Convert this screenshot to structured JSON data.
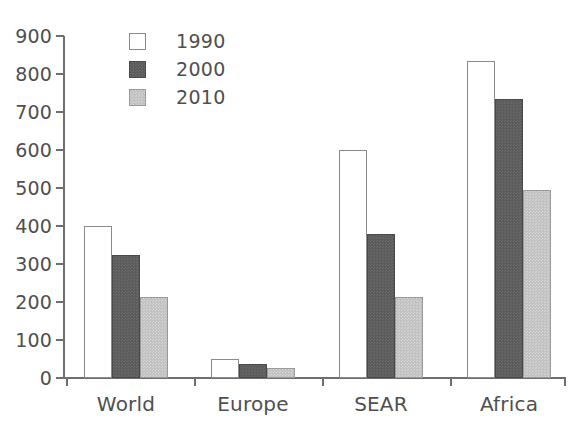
{
  "chart_data": {
    "type": "bar",
    "title": "",
    "xlabel": "",
    "ylabel": "",
    "categories": [
      "World",
      "Europe",
      "SEAR",
      "Africa"
    ],
    "series": [
      {
        "name": "1990",
        "color": "#ffffff",
        "values": [
          400,
          50,
          600,
          833
        ]
      },
      {
        "name": "2000",
        "color": "#5c5c5c",
        "values": [
          324,
          37,
          380,
          733
        ]
      },
      {
        "name": "2010",
        "color": "#c2c2c2",
        "values": [
          213,
          27,
          212,
          495
        ]
      }
    ],
    "ylim": [
      0,
      900
    ],
    "ytick_step": 100,
    "yticks": [
      0,
      100,
      200,
      300,
      400,
      500,
      600,
      700,
      800,
      900
    ],
    "ytick_labels": [
      "0",
      "100",
      "200",
      "300",
      "400",
      "500",
      "600",
      "700",
      "800",
      "900"
    ],
    "grid": false,
    "legend_position": "top-left",
    "axis_color": "#6e6e6e",
    "text_color": "#4f4f4f"
  },
  "legend": {
    "entries": [
      {
        "label": "1990",
        "swatch": "swatch-1990"
      },
      {
        "label": "2000",
        "swatch": "swatch-2000"
      },
      {
        "label": "2010",
        "swatch": "swatch-2010"
      }
    ]
  }
}
